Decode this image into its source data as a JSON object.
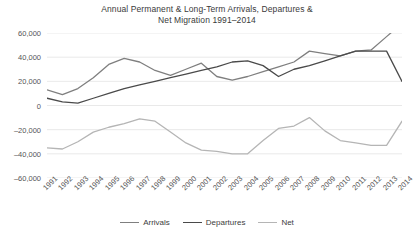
{
  "chart_data": {
    "type": "line",
    "title": "Annual Permanent & Long-Term Arrivals, Departures & Net Migration 1991–2014",
    "title_line1": "Annual Permanent & Long-Term Arrivals, Departures &",
    "title_line2": "Net Migration 1991–2014",
    "xlabel": "",
    "ylabel": "",
    "grid": true,
    "legend_position": "bottom",
    "ylim": [
      -60000,
      60000
    ],
    "yticks": [
      60000,
      40000,
      20000,
      0,
      -20000,
      -40000,
      -60000
    ],
    "ytick_labels": [
      "60,000",
      "40,000",
      "20,000",
      "0",
      "–20,000",
      "–40,000",
      "–60,000"
    ],
    "categories": [
      "1991",
      "1992",
      "1993",
      "1994",
      "1995",
      "1996",
      "1997",
      "1998",
      "1999",
      "2000",
      "2001",
      "2002",
      "2003",
      "2004",
      "2005",
      "2006",
      "2007",
      "2008",
      "2009",
      "2010",
      "2011",
      "2012",
      "2013",
      "2014"
    ],
    "series": [
      {
        "name": "Arrivals",
        "color": "#7f7f7f",
        "values": [
          13000,
          9000,
          14000,
          23000,
          34000,
          39000,
          36000,
          29000,
          25000,
          30000,
          35000,
          24000,
          21000,
          24000,
          28000,
          32000,
          36000,
          45000,
          43000,
          41000,
          45000,
          46000,
          57000,
          68000
        ]
      },
      {
        "name": "Departures",
        "color": "#4a4a4a",
        "values": [
          6000,
          3000,
          2000,
          6000,
          10000,
          14000,
          17000,
          20000,
          23000,
          26000,
          29000,
          32000,
          36000,
          37000,
          33000,
          24000,
          30000,
          33000,
          37000,
          41000,
          45000,
          45000,
          45000,
          20000
        ]
      },
      {
        "name": "Net",
        "color": "#b5b5b5",
        "values": [
          -35000,
          -36000,
          -30000,
          -22000,
          -18000,
          -15000,
          -11000,
          -13000,
          -22000,
          -31000,
          -37000,
          -38000,
          -40000,
          -40000,
          -29000,
          -19000,
          -17000,
          -10000,
          -21000,
          -29000,
          -31000,
          -33000,
          -33000,
          -13000
        ]
      }
    ]
  },
  "legend": {
    "items": [
      {
        "label": "Arrivals",
        "color": "#7f7f7f"
      },
      {
        "label": "Departures",
        "color": "#4a4a4a"
      },
      {
        "label": "Net",
        "color": "#b5b5b5"
      }
    ]
  }
}
